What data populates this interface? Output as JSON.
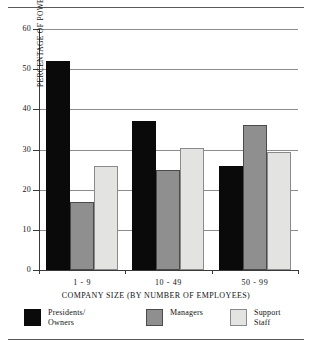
{
  "chart_data": {
    "type": "bar",
    "title": "",
    "subtitle": "",
    "xlabel": "COMPANY SIZE (BY NUMBER OF EMPLOYEES)",
    "ylabel": "PERCENTAGE OF POWER TO PURCHASE",
    "categories": [
      "1 - 9",
      "10 - 49",
      "50 - 99"
    ],
    "series": [
      {
        "name": "Presidents/\nOwners",
        "color": "#0a0a0a",
        "values": [
          52,
          37,
          26
        ]
      },
      {
        "name": "Managers",
        "color": "#8f8f8f",
        "values": [
          17,
          25,
          36
        ]
      },
      {
        "name": "Support Staff",
        "color": "#e3e3e1",
        "values": [
          26,
          30.5,
          29.5
        ]
      }
    ],
    "ylim": [
      0,
      60
    ],
    "yticks": [
      0,
      10,
      20,
      30,
      40,
      50,
      60
    ],
    "ytick_labels": [
      "0",
      "10",
      "20",
      "30",
      "40",
      "50",
      "60"
    ],
    "grid": true,
    "grid_axis": "y",
    "legend_position": "bottom",
    "legend": [
      "Presidents/\nOwners",
      "Managers",
      "Support Staff"
    ]
  }
}
